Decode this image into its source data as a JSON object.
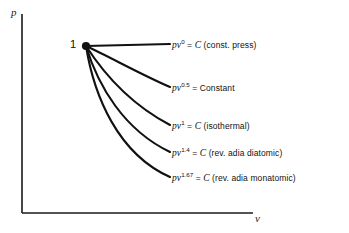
{
  "figure": {
    "background_color": "#ffffff",
    "line_color": "#111111",
    "axes": {
      "y_label": "p",
      "x_label": "v",
      "origin": [
        22,
        213
      ],
      "y_top": 14,
      "x_right": 253
    },
    "state_point": {
      "label": "1",
      "x": 86,
      "y": 46
    }
  },
  "chart_data": {
    "type": "line",
    "title": "",
    "xlabel": "v",
    "ylabel": "p",
    "grid": false,
    "legend": "inline-end-labels",
    "xlim": [
      22,
      253
    ],
    "ylim": [
      14,
      213
    ],
    "common_point": {
      "x": 86,
      "y": 46,
      "label": "1"
    },
    "series": [
      {
        "name": "pv^0 = C (const. press)",
        "n": 0,
        "symbol": "pv",
        "exponent": "0",
        "equals": "= C",
        "constant": "C",
        "note": "(const. press)",
        "label_x": 172,
        "label_y": 38,
        "endpoint": [
          170,
          44
        ],
        "path": "M 86,46 L 170,44"
      },
      {
        "name": "pv^0.5 = Constant",
        "n": 0.5,
        "symbol": "pv",
        "exponent": "0.5",
        "equals": "= Constant",
        "constant": "Constant",
        "note": "",
        "label_x": 172,
        "label_y": 81,
        "endpoint": [
          170,
          87
        ],
        "path": "M 86,46 C 110,57 140,74 170,87"
      },
      {
        "name": "pv^1 = C (isothermal)",
        "n": 1,
        "symbol": "pv",
        "exponent": "1",
        "equals": "= C",
        "constant": "C",
        "note": "(isothermal)",
        "label_x": 172,
        "label_y": 119,
        "endpoint": [
          170,
          125
        ],
        "path": "M 86,46 C 104,74 132,105 170,125"
      },
      {
        "name": "pv^1.4 = C (rev. adia diatomic)",
        "n": 1.4,
        "symbol": "pv",
        "exponent": "1.4",
        "equals": "= C",
        "constant": "C",
        "note": "(rev. adia diatomic)",
        "label_x": 172,
        "label_y": 146,
        "endpoint": [
          170,
          152
        ],
        "path": "M 86,46 C 98,86 124,130 170,152"
      },
      {
        "name": "pv^1.67 = C (rev. adia monatomic)",
        "n": 1.67,
        "symbol": "pv",
        "exponent": "1.67",
        "equals": "= C",
        "constant": "C",
        "note": "(rev. adia monatomic)",
        "label_x": 172,
        "label_y": 171,
        "endpoint": [
          170,
          177
        ],
        "path": "M 86,46 C 94,96 118,154 170,177"
      }
    ]
  }
}
